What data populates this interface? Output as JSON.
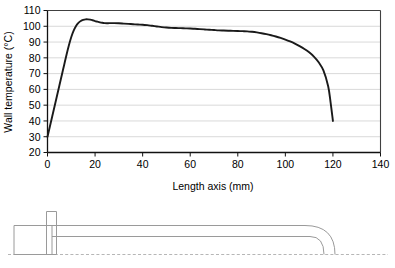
{
  "chart_data": {
    "type": "line",
    "title": "",
    "xlabel": "Length axis (mm)",
    "ylabel": "Wall temperature (°C)",
    "xlim": [
      0,
      140
    ],
    "ylim": [
      20,
      110
    ],
    "xticks": [
      "0",
      "20",
      "40",
      "60",
      "80",
      "100",
      "120",
      "140"
    ],
    "xtick_values": [
      0,
      20,
      40,
      60,
      80,
      100,
      120,
      140
    ],
    "yticks": [
      "20",
      "30",
      "40",
      "50",
      "60",
      "70",
      "80",
      "90",
      "100",
      "110"
    ],
    "ytick_values": [
      20,
      30,
      40,
      50,
      60,
      70,
      80,
      90,
      100,
      110
    ],
    "grid": "horizontal",
    "legend": "none",
    "line_color": "#1a1a1a",
    "grid_color": "#d9d9d9",
    "axis_color": "#404040",
    "series": [
      {
        "name": "Wall temperature",
        "x": [
          0,
          1,
          2,
          3,
          4,
          5,
          6,
          7,
          8,
          9,
          10,
          11,
          12,
          13,
          14,
          15,
          16,
          17,
          18,
          19,
          20,
          21,
          22,
          23,
          24,
          25,
          26,
          28,
          30,
          32,
          34,
          36,
          38,
          40,
          42,
          44,
          46,
          48,
          50,
          52,
          54,
          56,
          58,
          60,
          62,
          64,
          66,
          68,
          70,
          72,
          74,
          76,
          78,
          80,
          82,
          84,
          86,
          88,
          90,
          92,
          94,
          96,
          98,
          100,
          102,
          104,
          106,
          108,
          110,
          112,
          114,
          116,
          118,
          119,
          120
        ],
        "values": [
          30.0,
          36.5,
          43.0,
          49.5,
          56.0,
          62.5,
          69.0,
          75.5,
          82.0,
          88.0,
          93.2,
          97.2,
          100.2,
          102.1,
          103.3,
          104.0,
          104.4,
          104.4,
          104.2,
          103.8,
          103.3,
          102.9,
          102.5,
          102.2,
          102.0,
          101.9,
          102.0,
          102.0,
          101.9,
          101.7,
          101.5,
          101.3,
          101.1,
          101.0,
          100.7,
          100.3,
          99.9,
          99.5,
          99.2,
          99.0,
          98.9,
          98.8,
          98.7,
          98.6,
          98.4,
          98.2,
          98.0,
          97.8,
          97.6,
          97.4,
          97.3,
          97.2,
          97.1,
          97.0,
          96.9,
          96.8,
          96.5,
          96.1,
          95.6,
          95.0,
          94.3,
          93.5,
          92.6,
          91.6,
          90.4,
          89.0,
          87.4,
          85.6,
          83.5,
          80.8,
          77.2,
          72.0,
          62.0,
          52.0,
          40.0
        ]
      }
    ]
  },
  "schematic": {
    "name": "heated-tube-cross-section",
    "parts": [
      {
        "label": "header-block"
      },
      {
        "label": "vertical-fin"
      },
      {
        "label": "tube-outer-wall"
      },
      {
        "label": "tube-inner-wall"
      },
      {
        "label": "centerline"
      }
    ],
    "line_color": "#9a9a9a",
    "centerline_color": "#b0b0b0"
  }
}
